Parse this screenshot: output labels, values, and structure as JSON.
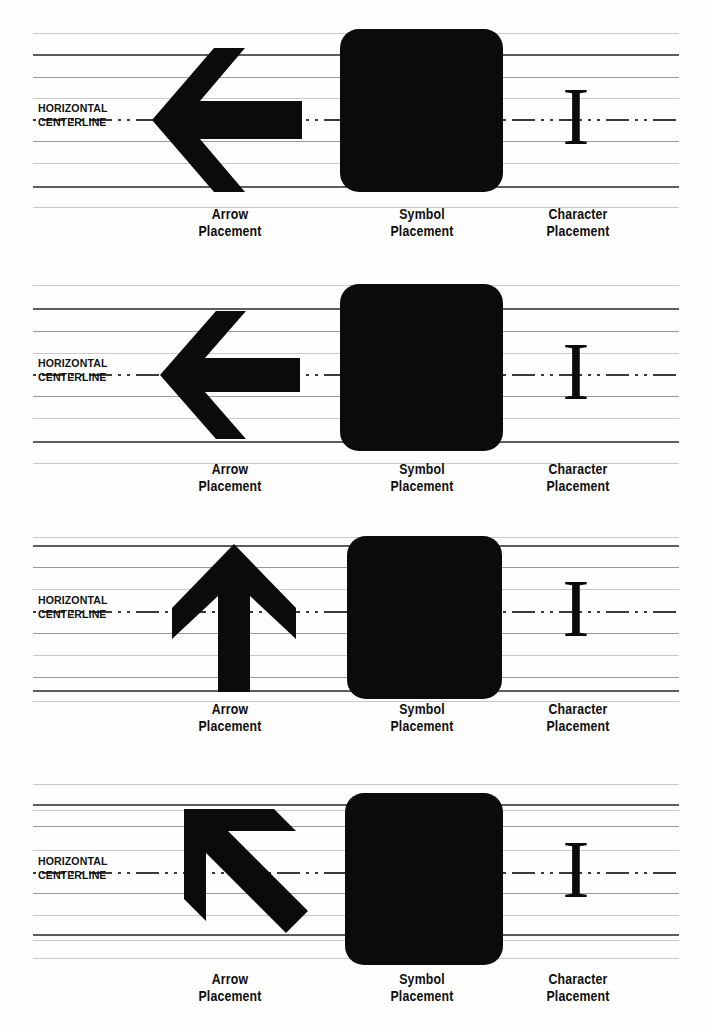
{
  "figure": {
    "background": "#ffffff",
    "ink_color": "#0b0b0b",
    "line_color": "#9a9a9a",
    "heavy_line_color": "#5d5d5d",
    "centerline_color": "#3a3a3a"
  },
  "centerline_label": {
    "line1": "HORIZONTAL",
    "line2": "CENTERLINE"
  },
  "captions": {
    "arrow": {
      "line1": "Arrow",
      "line2": "Placement"
    },
    "symbol": {
      "line1": "Symbol",
      "line2": "Placement"
    },
    "character": {
      "line1": "Character",
      "line2": "Placement"
    }
  },
  "character_glyph": "I",
  "panels": [
    {
      "index": 1,
      "arrow_name": "left-arrow-large",
      "arrow_direction": "left",
      "symbol_name": "rounded-square-symbol",
      "character": "I"
    },
    {
      "index": 2,
      "arrow_name": "left-arrow-medium",
      "arrow_direction": "left",
      "symbol_name": "rounded-square-symbol",
      "character": "I"
    },
    {
      "index": 3,
      "arrow_name": "up-arrow",
      "arrow_direction": "up",
      "symbol_name": "rounded-square-symbol",
      "character": "I"
    },
    {
      "index": 4,
      "arrow_name": "diagonal-up-left-arrow",
      "arrow_direction": "up-left",
      "symbol_name": "rounded-square-symbol",
      "character": "I"
    }
  ]
}
